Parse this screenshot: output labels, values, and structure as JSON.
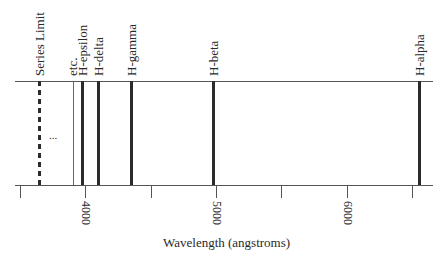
{
  "diagram": {
    "axis": {
      "title": "Wavelength (angstroms)",
      "tick_labels": [
        {
          "value": "4000",
          "x": 85
        },
        {
          "value": "5000",
          "x": 216
        },
        {
          "value": "6000",
          "x": 347
        }
      ],
      "minor_ticks_x": [
        20,
        151,
        281,
        412
      ]
    },
    "lines": [
      {
        "label": "Series Limit",
        "x": 40,
        "style": "dashed"
      },
      {
        "label": "etc.",
        "x": 73,
        "style": "thin"
      },
      {
        "label": "H-epsilon",
        "x": 82,
        "style": "thick"
      },
      {
        "label": "H-delta",
        "x": 98,
        "style": "thick"
      },
      {
        "label": "H-gamma",
        "x": 131,
        "style": "thick"
      },
      {
        "label": "H-beta",
        "x": 213,
        "style": "thick"
      },
      {
        "label": "H-alpha",
        "x": 419,
        "style": "thick"
      }
    ],
    "ellipsis": "..."
  }
}
